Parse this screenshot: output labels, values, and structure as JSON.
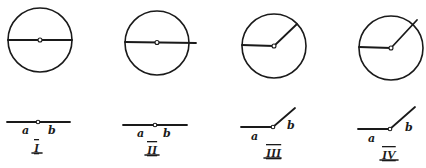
{
  "figures": [
    {
      "id": "I",
      "numeral": "I",
      "description": "Full circle with diameter; straight angle",
      "ray_a_label": "a",
      "ray_b_label": "b",
      "angle_degrees": 180,
      "ray_b_extends_beyond_circle": false
    },
    {
      "id": "II",
      "numeral": "II",
      "description": "Full circle with diameter extending past the circle; straight angle",
      "ray_a_label": "a",
      "ray_b_label": "b",
      "angle_degrees": 180,
      "ray_b_extends_beyond_circle": true
    },
    {
      "id": "III",
      "numeral": "III",
      "description": "Circle with two radii forming an obtuse angle",
      "ray_a_label": "a",
      "ray_b_label": "b",
      "angle_degrees": 135,
      "ray_b_extends_beyond_circle": false
    },
    {
      "id": "IV",
      "numeral": "IV",
      "description": "Circle with two rays forming an obtuse angle, one ray extending past the circle",
      "ray_a_label": "a",
      "ray_b_label": "b",
      "angle_degrees": 135,
      "ray_b_extends_beyond_circle": true
    }
  ],
  "colors": {
    "ink": "#1a1a1a",
    "paper": "#ffffff"
  }
}
